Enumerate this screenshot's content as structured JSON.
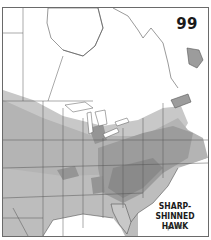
{
  "map": {
    "number": "99",
    "species_line1": "SHARP-SHINNED",
    "species_line2": "HAWK",
    "page_ref": "p. 98"
  },
  "legend_colors": {
    "background": "#ffffff",
    "winter_range": "#c8c8c8",
    "year_round_range": "#a6a6a6",
    "breeding_dense": "#8a8a8a",
    "boundary_lines": "#555555",
    "water": "#ffffff"
  }
}
